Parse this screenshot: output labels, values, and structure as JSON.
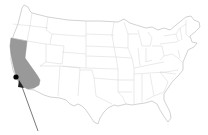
{
  "map": {
    "title": "",
    "region": "Contiguous United States",
    "highlighted_state": "California",
    "highlight_color": "#999999",
    "state_fill": "#ffffff",
    "border_color": "#c8c8c8",
    "marker": {
      "type": "dot",
      "color": "#000000",
      "location_description": "Off the Southern California coast"
    },
    "arrow": {
      "color": "#555555",
      "points_to": "marker"
    }
  }
}
